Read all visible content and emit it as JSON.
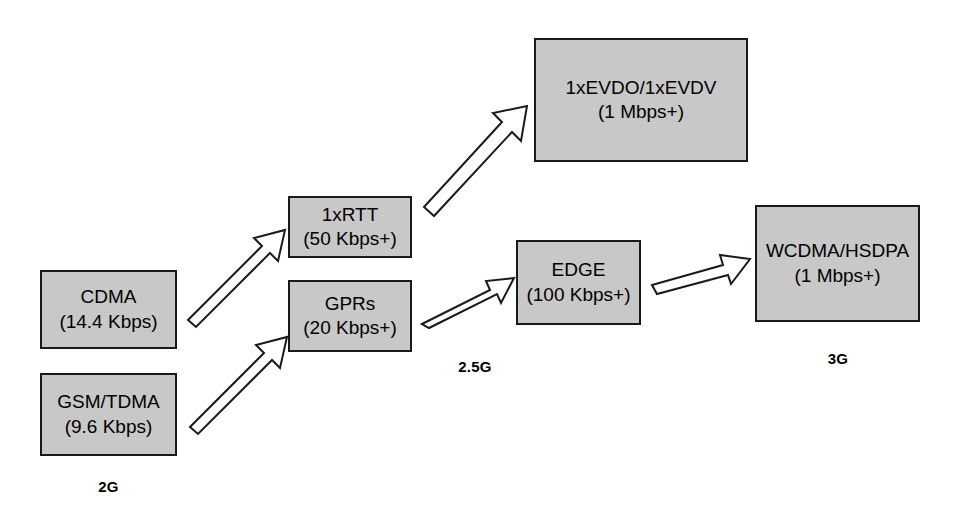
{
  "diagram": {
    "type": "flow-diagram",
    "background_color": "#ffffff",
    "box_fill_color": "#c8c8c8",
    "box_border_color": "#1a1a1a",
    "arrow_fill_color": "#ffffff",
    "arrow_border_color": "#1a1a1a",
    "nodes": [
      {
        "id": "cdma",
        "title": "CDMA",
        "rate": "(14.4 Kbps)",
        "generation": "2G"
      },
      {
        "id": "gsm_tdma",
        "title": "GSM/TDMA",
        "rate": "(9.6 Kbps)",
        "generation": "2G"
      },
      {
        "id": "onexrtt",
        "title": "1xRTT",
        "rate": "(50 Kbps+)",
        "generation": "2.5G"
      },
      {
        "id": "gprs",
        "title": "GPRs",
        "rate": "(20 Kbps+)",
        "generation": "2.5G"
      },
      {
        "id": "evdo",
        "title": "1xEVDO/1xEVDV",
        "rate": "(1 Mbps+)",
        "generation": "3G"
      },
      {
        "id": "edge",
        "title": "EDGE",
        "rate": "(100 Kbps+)",
        "generation": "2.5G"
      },
      {
        "id": "wcdma",
        "title": "WCDMA/HSDPA",
        "rate": "(1 Mbps+)",
        "generation": "3G"
      }
    ],
    "generation_labels": [
      {
        "id": "gen_2g",
        "label": "2G"
      },
      {
        "id": "gen_25g",
        "label": "2.5G"
      },
      {
        "id": "gen_3g",
        "label": "3G"
      }
    ],
    "connections": [
      {
        "id": "cdma-to-1xrtt",
        "from": "CDMA",
        "to": "1xRTT",
        "style": "hollow-block-arrow"
      },
      {
        "id": "gsm-to-gprs",
        "from": "GSM/TDMA",
        "to": "GPRs",
        "style": "hollow-block-arrow"
      },
      {
        "id": "1xrtt-to-evdo",
        "from": "1xRTT",
        "to": "1xEVDO/1xEVDV",
        "style": "hollow-block-arrow"
      },
      {
        "id": "gprs-to-edge",
        "from": "GPRs",
        "to": "EDGE",
        "style": "hollow-block-arrow"
      },
      {
        "id": "edge-to-wcdma",
        "from": "EDGE",
        "to": "WCDMA/HSDPA",
        "style": "hollow-block-arrow"
      }
    ]
  }
}
